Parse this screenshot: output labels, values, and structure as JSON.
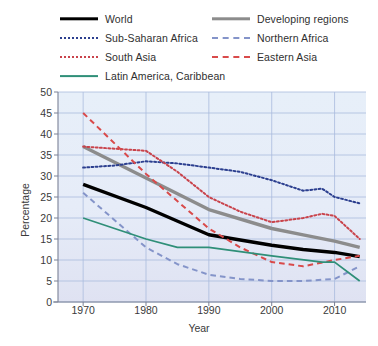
{
  "legend": {
    "columns": [
      {
        "items": [
          {
            "label": "World",
            "style": "solid-thick",
            "color": "#000000",
            "key": "world"
          },
          {
            "label": "Sub-Saharan Africa",
            "style": "dotted",
            "color": "#2c3f8f",
            "key": "ssa"
          },
          {
            "label": "South Asia",
            "style": "dotted",
            "color": "#c9434b",
            "key": "sa"
          },
          {
            "label": "Latin America, Caribbean",
            "style": "solid",
            "color": "#2f8f78",
            "key": "lac"
          }
        ]
      },
      {
        "items": [
          {
            "label": "Developing regions",
            "style": "solid-thick",
            "color": "#8c8c8c",
            "key": "developing"
          },
          {
            "label": "Northern Africa",
            "style": "dashed",
            "color": "#8494c9",
            "key": "na"
          },
          {
            "label": "Eastern Asia",
            "style": "dashed",
            "color": "#d94a4a",
            "key": "ea"
          }
        ]
      }
    ]
  },
  "chart_data": {
    "type": "line",
    "title": "",
    "xlabel": "Year",
    "ylabel": "Percentage",
    "xlim": [
      1966,
      2015
    ],
    "ylim": [
      0,
      50
    ],
    "ytick_values": [
      0,
      5,
      10,
      15,
      20,
      25,
      30,
      35,
      40,
      45,
      50
    ],
    "ytick_labels": [
      "0",
      "5",
      "10",
      "15",
      "20",
      "25",
      "30",
      "35",
      "40",
      "45",
      "50"
    ],
    "xtick_values": [
      1970,
      1980,
      1990,
      2000,
      2010
    ],
    "xtick_labels": [
      "1970",
      "1980",
      "1990",
      "2000",
      "2010"
    ],
    "grid": true,
    "legend_position": "above-plot",
    "plot_background": "#e8eef8",
    "grid_color": "#aabbdd",
    "series": [
      {
        "name": "World",
        "key": "world",
        "color": "#000000",
        "style": "solid-thick",
        "width": 3.4,
        "x": [
          1970,
          1980,
          1990,
          2000,
          2005,
          2010,
          2014
        ],
        "values": [
          28.0,
          22.5,
          16.0,
          13.5,
          12.5,
          11.8,
          10.8
        ]
      },
      {
        "name": "Developing regions",
        "key": "developing",
        "color": "#8c8c8c",
        "style": "solid-thick",
        "width": 3.4,
        "x": [
          1970,
          1980,
          1990,
          2000,
          2005,
          2010,
          2014
        ],
        "values": [
          37.0,
          29.5,
          22.0,
          17.5,
          16.0,
          14.5,
          13.0
        ]
      },
      {
        "name": "Sub-Saharan Africa",
        "key": "ssa",
        "color": "#2c3f8f",
        "style": "dotted",
        "width": 2.0,
        "x": [
          1970,
          1975,
          1980,
          1985,
          1990,
          1995,
          2000,
          2005,
          2008,
          2010,
          2014
        ],
        "values": [
          32.0,
          32.5,
          33.5,
          33.0,
          32.0,
          31.0,
          29.0,
          26.5,
          27.0,
          25.0,
          23.5
        ]
      },
      {
        "name": "South Asia",
        "key": "sa",
        "color": "#c9434b",
        "style": "dotted",
        "width": 2.0,
        "x": [
          1970,
          1975,
          1980,
          1985,
          1990,
          1995,
          2000,
          2005,
          2008,
          2010,
          2014
        ],
        "values": [
          37.0,
          36.5,
          36.0,
          31.0,
          25.0,
          21.5,
          19.0,
          20.0,
          21.0,
          20.5,
          15.0
        ]
      },
      {
        "name": "Northern Africa",
        "key": "na",
        "color": "#8494c9",
        "style": "dashed",
        "width": 2.0,
        "x": [
          1970,
          1980,
          1985,
          1990,
          1995,
          2000,
          2005,
          2010,
          2014
        ],
        "values": [
          26.0,
          13.0,
          9.0,
          6.5,
          5.5,
          5.0,
          5.0,
          5.5,
          8.5
        ]
      },
      {
        "name": "Eastern Asia",
        "key": "ea",
        "color": "#d94a4a",
        "style": "dashed",
        "width": 2.0,
        "x": [
          1970,
          1980,
          1990,
          1995,
          2000,
          2005,
          2010,
          2014
        ],
        "values": [
          45.0,
          30.5,
          17.5,
          13.0,
          9.5,
          8.5,
          10.0,
          11.0
        ]
      },
      {
        "name": "Latin America, Caribbean",
        "key": "lac",
        "color": "#2f8f78",
        "style": "solid",
        "width": 1.8,
        "x": [
          1970,
          1980,
          1985,
          1990,
          2000,
          2008,
          2010,
          2014
        ],
        "values": [
          20.0,
          15.0,
          13.0,
          13.0,
          11.0,
          9.5,
          9.5,
          5.0
        ]
      }
    ]
  }
}
